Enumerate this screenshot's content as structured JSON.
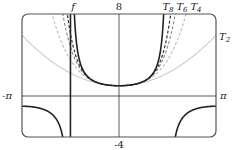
{
  "chart_data": {
    "type": "line",
    "title": "",
    "xlabel": "",
    "ylabel": "",
    "xlim": [
      -3.14159,
      3.14159
    ],
    "ylim": [
      -4,
      8
    ],
    "x_tick_labels": {
      "left": "-π",
      "right": "π"
    },
    "y_tick_labels": {
      "top": "8",
      "bottom": "-4"
    },
    "grid": false,
    "series": [
      {
        "name": "f",
        "label": "f",
        "expr": "sec(x)",
        "style": "solid-dark"
      },
      {
        "name": "T8",
        "label": "T8",
        "expr": "1 + x^2/2 + 5x^4/24 + 61x^6/720 + 277x^8/8064",
        "coeffs": [
          1,
          0.5,
          0.2083333,
          0.0847222,
          0.0343502
        ],
        "style": "dashed-dark"
      },
      {
        "name": "T6",
        "label": "T6",
        "expr": "1 + x^2/2 + 5x^4/24 + 61x^6/720",
        "coeffs": [
          1,
          0.5,
          0.2083333,
          0.0847222
        ],
        "style": "dashed-gray"
      },
      {
        "name": "T4",
        "label": "T4",
        "expr": "1 + x^2/2 + 5x^4/24",
        "coeffs": [
          1,
          0.5,
          0.2083333
        ],
        "style": "dashed-light"
      },
      {
        "name": "T2",
        "label": "T2",
        "expr": "1 + x^2/2",
        "coeffs": [
          1,
          0.5
        ],
        "style": "solid-light"
      }
    ],
    "colors": {
      "f": "#222222",
      "T8": "#333333",
      "T6": "#888888",
      "T4": "#bbbbbb",
      "T2": "#cccccc",
      "frame": "#555555"
    }
  }
}
